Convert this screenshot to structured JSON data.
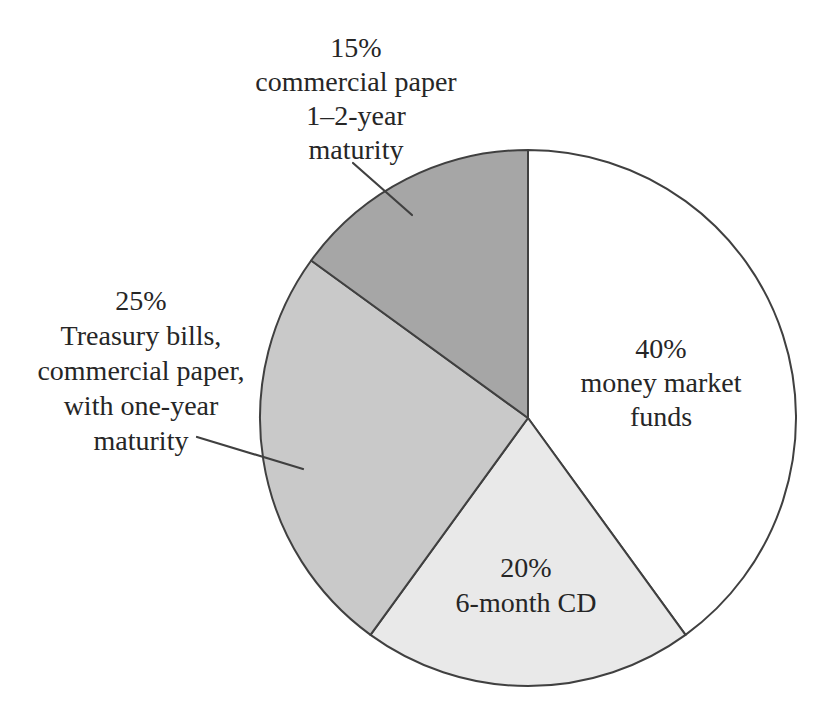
{
  "chart_data": {
    "type": "pie",
    "title": "",
    "legend_position": "none",
    "direction": "clockwise",
    "start_angle_deg_from_12_oclock": 0,
    "outline_color": "#404040",
    "text_color": "#262626",
    "background_color": "#ffffff",
    "slices": [
      {
        "id": "money-market-funds",
        "name": "money market funds",
        "value_pct": 40,
        "color": "#ffffff",
        "label_placement": "inside",
        "label_lines": [
          "40%",
          "money market",
          "funds"
        ]
      },
      {
        "id": "six-month-cd",
        "name": "6-month CD",
        "value_pct": 20,
        "color": "#e9e9e9",
        "label_placement": "inside",
        "label_lines": [
          "20%",
          "6-month CD"
        ]
      },
      {
        "id": "treasury-bills-commercial-paper-one-year",
        "name": "Treasury bills, commercial paper, with one-year maturity",
        "value_pct": 25,
        "color": "#c9c9c9",
        "label_placement": "outside-left",
        "label_lines": [
          "25%",
          "Treasury bills,",
          "commercial paper,",
          "with one-year",
          "maturity"
        ]
      },
      {
        "id": "commercial-paper-1-2-year",
        "name": "commercial paper 1–2-year maturity",
        "value_pct": 15,
        "color": "#a6a6a6",
        "label_placement": "outside-top",
        "label_lines": [
          "15%",
          "commercial paper",
          "1–2-year",
          "maturity"
        ]
      }
    ]
  }
}
